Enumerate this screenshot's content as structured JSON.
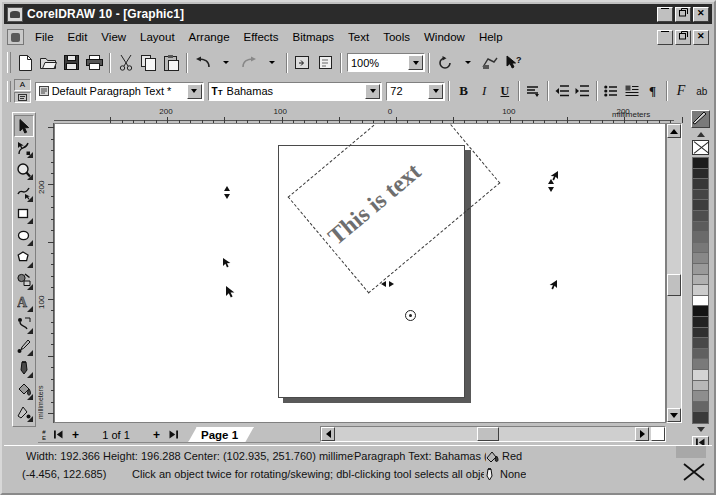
{
  "window": {
    "title": "CorelDRAW 10 - [Graphic1]",
    "app_icon": "coreldraw-icon",
    "buttons": {
      "minimize": "_",
      "restore": "❐",
      "close": "×"
    }
  },
  "menu": {
    "doc_icon": "document-icon",
    "items": [
      {
        "label": "File"
      },
      {
        "label": "Edit"
      },
      {
        "label": "View"
      },
      {
        "label": "Layout"
      },
      {
        "label": "Arrange"
      },
      {
        "label": "Effects"
      },
      {
        "label": "Bitmaps"
      },
      {
        "label": "Text"
      },
      {
        "label": "Tools"
      },
      {
        "label": "Window"
      },
      {
        "label": "Help"
      }
    ],
    "doc_buttons": {
      "minimize": "_",
      "restore": "❐",
      "close": "×"
    }
  },
  "standard_toolbar": {
    "buttons": [
      {
        "name": "new-document-button",
        "glyph": "□"
      },
      {
        "name": "open-document-button",
        "glyph": "📂"
      },
      {
        "name": "save-document-button",
        "glyph": "💾"
      },
      {
        "name": "print-button",
        "glyph": "🖨"
      },
      {
        "name": "cut-button",
        "glyph": "✂"
      },
      {
        "name": "copy-button",
        "glyph": "⧉"
      },
      {
        "name": "paste-button",
        "glyph": "📋"
      },
      {
        "name": "undo-button",
        "glyph": "↶"
      },
      {
        "name": "undo-dropdown-button",
        "glyph": "▾"
      },
      {
        "name": "redo-button",
        "glyph": "↷"
      },
      {
        "name": "redo-dropdown-button",
        "glyph": "▾"
      },
      {
        "name": "import-button",
        "glyph": "⬚"
      },
      {
        "name": "export-button",
        "glyph": "⬚"
      }
    ],
    "zoom_level": "100%",
    "zoom_placeholder": "Zoom level",
    "refresh_button": "⟳",
    "refresh_dropdown": "▾",
    "app_launcher_button": "launcher-icon",
    "whats_this_button": "❓"
  },
  "text_property_bar": {
    "style_icon": "paragraph-style-icon",
    "style_value": "Default Paragraph Text *",
    "style_placeholder": "Style",
    "font_icon": "truetype-icon",
    "font_value": "Bahamas",
    "font_placeholder": "Font list",
    "size_value": "72",
    "size_placeholder": "Font size",
    "buttons": [
      {
        "name": "bold-button",
        "label": "B"
      },
      {
        "name": "italic-button",
        "label": "I"
      },
      {
        "name": "underline-button",
        "label": "U"
      },
      {
        "name": "text-align-button",
        "label": "≡"
      },
      {
        "name": "decrease-indent-button",
        "label": "⇤"
      },
      {
        "name": "increase-indent-button",
        "label": "⇥"
      },
      {
        "name": "bulleted-list-button",
        "label": "☰"
      },
      {
        "name": "drop-cap-button",
        "label": "☷"
      },
      {
        "name": "show-nonprinting-characters-button",
        "label": "¶"
      },
      {
        "name": "format-text-button",
        "label": "F"
      },
      {
        "name": "edit-text-button",
        "label": "ab"
      }
    ]
  },
  "toolbox": {
    "tools": [
      {
        "name": "pick-tool",
        "selected": true
      },
      {
        "name": "shape-tool",
        "selected": false
      },
      {
        "name": "zoom-tool",
        "selected": false
      },
      {
        "name": "freehand-tool",
        "selected": false
      },
      {
        "name": "rectangle-tool",
        "selected": false
      },
      {
        "name": "ellipse-tool",
        "selected": false
      },
      {
        "name": "polygon-tool",
        "selected": false
      },
      {
        "name": "basic-shapes-tool",
        "selected": false
      },
      {
        "name": "text-tool",
        "selected": false
      },
      {
        "name": "interactive-blend-tool",
        "selected": false
      },
      {
        "name": "eyedropper-tool",
        "selected": false
      },
      {
        "name": "outline-tool",
        "selected": false
      },
      {
        "name": "fill-tool",
        "selected": false
      },
      {
        "name": "interactive-fill-tool",
        "selected": false
      }
    ]
  },
  "rulers": {
    "unit_label": "millimeters",
    "horizontal_labels": [
      "200",
      "100",
      "0",
      "100",
      "200",
      "300",
      "400"
    ],
    "vertical_labels": [
      "300",
      "200",
      "100"
    ],
    "corner_unit": "mm"
  },
  "canvas": {
    "object_text": "This is text",
    "rotation_center": "rotation-center-marker",
    "selection_mode": "rotate-skew"
  },
  "page_navigator": {
    "first_page_button": "⏮",
    "add_page_before_button": "+",
    "page_counter": "1 of 1",
    "add_page_after_button": "+",
    "last_page_button": "⏭",
    "current_page_tab": "Page 1"
  },
  "scrollbars": {
    "vertical_up": "▲",
    "vertical_down": "▼",
    "horizontal_left": "◀",
    "horizontal_right": "▶"
  },
  "palette": {
    "top_swatch": "custom-color-swatch",
    "scroll_up": "▲",
    "scroll_down": "▼",
    "no_color_label": "No color",
    "expand_button": "⏮",
    "swatches": [
      "#1c1c1c",
      "#2a2a2a",
      "#383838",
      "#454545",
      "#3d3d3d",
      "#4e4e4e",
      "#5c5c5c",
      "#6a6a6a",
      "#787878",
      "#888888",
      "#9a9a9a",
      "#b0b0b0",
      "#cccccc",
      "#ffffff",
      "#141414",
      "#222222",
      "#303030",
      "#484848",
      "#606060",
      "#7a7a7a",
      "#d4d4d4",
      "#b8b8b8",
      "#8e8e8e",
      "#666666",
      "#3a3a3a"
    ]
  },
  "status_bar": {
    "dimensions": "Width: 192.366  Height: 196.288  Center: (102.935, 251.760)  millimet...",
    "object_info": "Paragraph Text: Bahamas (N...",
    "fill_icon": "fill-color-icon",
    "fill_color": "Red",
    "cursor_position": "(-4.456, 122.685)",
    "hint": "Click an object twice for rotating/skewing; dbl-clicking tool selects all objects; ...",
    "outline_icon": "outline-pen-icon",
    "outline_color": "None",
    "close_button": "✕"
  }
}
